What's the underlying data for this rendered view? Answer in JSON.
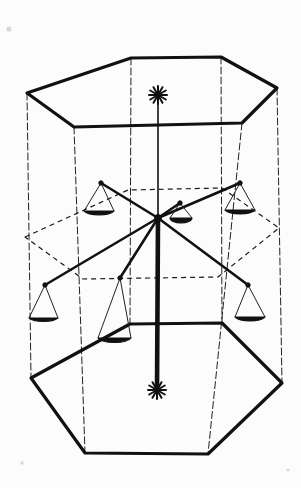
{
  "figure": {
    "caption": "",
    "medium": "pen-and-ink line drawing",
    "background_color": "#fcfcfc",
    "ink_color": "#111111",
    "width": 301,
    "height": 488
  },
  "style": {
    "solid_edge_width": 3.2,
    "thin_edge_width": 1.0,
    "hidden_edge_width": 1.2,
    "hidden_dash": "5 4",
    "vertical_dash": "7 3",
    "arm_width": 2.6,
    "mast_width": 4.6,
    "pan_string_width": 1.0
  },
  "geometry": {
    "top_hexagon": {
      "name": "top-hexagon",
      "closed": true,
      "visible_front": true,
      "points": [
        [
          27,
          93
        ],
        [
          131,
          58
        ],
        [
          221,
          57
        ],
        [
          277,
          88
        ],
        [
          242,
          123
        ],
        [
          74,
          127
        ]
      ],
      "front_edge_indices": [
        3,
        4,
        5,
        0
      ],
      "back_edge_indices": [
        0,
        1,
        2,
        3
      ]
    },
    "bottom_hexagon": {
      "name": "bottom-hexagon",
      "closed": true,
      "visible_front": true,
      "points": [
        [
          31,
          378
        ],
        [
          130,
          324
        ],
        [
          222,
          323
        ],
        [
          282,
          383
        ],
        [
          208,
          454
        ],
        [
          85,
          453
        ]
      ]
    },
    "mid_hexagon": {
      "name": "mid-hexagon-hidden",
      "closed": true,
      "hidden": true,
      "points": [
        [
          25,
          237
        ],
        [
          128,
          190
        ],
        [
          222,
          188
        ],
        [
          279,
          228
        ],
        [
          218,
          277
        ],
        [
          83,
          279
        ]
      ]
    },
    "vertical_edges": [
      {
        "name": "vertical-edge-left",
        "from": [
          27,
          93
        ],
        "to": [
          31,
          378
        ],
        "style": "dashed"
      },
      {
        "name": "vertical-edge-back-left",
        "from": [
          131,
          58
        ],
        "to": [
          130,
          324
        ],
        "style": "dashed"
      },
      {
        "name": "vertical-edge-back-right",
        "from": [
          221,
          57
        ],
        "to": [
          222,
          323
        ],
        "style": "dashed"
      },
      {
        "name": "vertical-edge-right",
        "from": [
          277,
          88
        ],
        "to": [
          282,
          383
        ],
        "style": "dashed"
      },
      {
        "name": "vertical-edge-front-right",
        "from": [
          242,
          123
        ],
        "to": [
          208,
          454
        ],
        "style": "dashed"
      },
      {
        "name": "vertical-edge-front-left",
        "from": [
          74,
          127
        ],
        "to": [
          85,
          453
        ],
        "style": "dashed"
      }
    ],
    "mast": {
      "name": "central-mast",
      "top": [
        158,
        100
      ],
      "bottom": [
        157,
        390
      ],
      "hub": [
        158,
        218
      ],
      "upper_thin_segment_end": [
        158,
        218
      ],
      "lower_thick_segment_start": [
        158,
        218
      ]
    },
    "finials": [
      {
        "name": "top-asterisk-finial",
        "cx": 158,
        "cy": 95,
        "radius": 9,
        "spokes": 6
      },
      {
        "name": "bottom-asterisk-finial",
        "cx": 157,
        "cy": 390,
        "radius": 9,
        "spokes": 6
      }
    ],
    "arms": [
      {
        "name": "arm-back-left",
        "from": [
          158,
          218
        ],
        "to": [
          101,
          183
        ]
      },
      {
        "name": "arm-back-right",
        "from": [
          158,
          218
        ],
        "to": [
          240,
          183
        ]
      },
      {
        "name": "arm-front-left",
        "from": [
          158,
          218
        ],
        "to": [
          45,
          285
        ]
      },
      {
        "name": "arm-front-right",
        "from": [
          158,
          218
        ],
        "to": [
          248,
          285
        ]
      },
      {
        "name": "arm-front-near",
        "from": [
          158,
          218
        ],
        "to": [
          120,
          278
        ]
      },
      {
        "name": "arm-short-right",
        "from": [
          158,
          218
        ],
        "to": [
          180,
          203
        ]
      }
    ],
    "pans": [
      {
        "name": "pan-back-left",
        "anchor": [
          101,
          183
        ],
        "bowl_center": [
          99,
          213
        ],
        "bowl_rx": 16,
        "bowl_ry": 6,
        "string_left": [
          84,
          211
        ],
        "string_right": [
          114,
          211
        ]
      },
      {
        "name": "pan-back-right",
        "anchor": [
          240,
          183
        ],
        "bowl_center": [
          240,
          212
        ],
        "bowl_rx": 16,
        "bowl_ry": 6,
        "string_left": [
          225,
          210
        ],
        "string_right": [
          255,
          210
        ]
      },
      {
        "name": "pan-front-left",
        "anchor": [
          45,
          285
        ],
        "bowl_center": [
          43,
          320
        ],
        "bowl_rx": 16,
        "bowl_ry": 6,
        "string_left": [
          29,
          318
        ],
        "string_right": [
          58,
          318
        ]
      },
      {
        "name": "pan-front-right",
        "anchor": [
          248,
          285
        ],
        "bowl_center": [
          250,
          319
        ],
        "bowl_rx": 16,
        "bowl_ry": 6,
        "string_left": [
          235,
          317
        ],
        "string_right": [
          265,
          317
        ]
      },
      {
        "name": "pan-front-near",
        "anchor": [
          120,
          278
        ],
        "bowl_center": [
          114,
          340
        ],
        "bowl_rx": 17,
        "bowl_ry": 6,
        "string_left": [
          98,
          338
        ],
        "string_right": [
          131,
          338
        ]
      },
      {
        "name": "pan-short-right",
        "anchor": [
          180,
          203
        ],
        "bowl_center": [
          181,
          219
        ],
        "bowl_rx": 11,
        "bowl_ry": 5,
        "string_left": [
          170,
          218
        ],
        "string_right": [
          192,
          218
        ]
      }
    ],
    "specks": [
      {
        "name": "paper-speck-top-left",
        "cx": 9,
        "cy": 29,
        "r": 2.6
      },
      {
        "name": "paper-speck-bottom-left",
        "cx": 22,
        "cy": 463,
        "r": 1.8
      },
      {
        "name": "paper-speck-bottom-right",
        "cx": 288,
        "cy": 470,
        "r": 1.6
      }
    ]
  }
}
